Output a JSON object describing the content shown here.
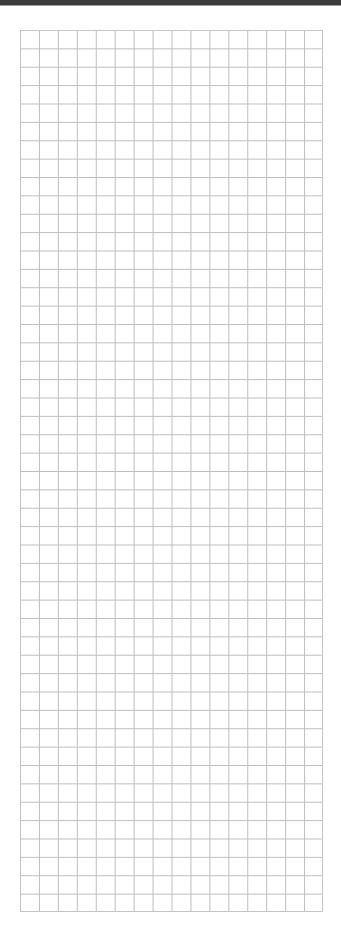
{
  "page": {
    "type": "blank-grid-paper",
    "top_band_color": "#3c3c3c",
    "background_color": "#ffffff"
  },
  "grid": {
    "columns": 16,
    "rows": 48,
    "line_color": "#bdbdbd",
    "border_color": "#c4c4c4",
    "cells_content": []
  }
}
